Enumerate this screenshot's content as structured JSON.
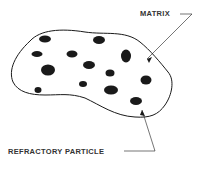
{
  "diagram": {
    "labels": {
      "matrix": "MATRIX",
      "particle": "REFRACTORY PARTICLE"
    },
    "colors": {
      "ink": "#1a1a1a",
      "background": "#ffffff"
    }
  }
}
